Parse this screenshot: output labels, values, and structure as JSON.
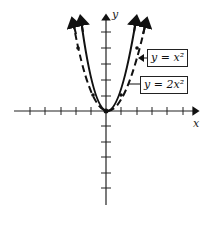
{
  "labels": {
    "curve1": "y = x²",
    "curve2": "y = 2x²",
    "x_axis": "x",
    "y_axis": "y"
  },
  "diagram": {
    "type": "coordinate-plane-parabolas",
    "x_ticks_each_side": 5,
    "y_ticks_above": 5,
    "y_ticks_below": 5,
    "curves": [
      {
        "name": "y = x²",
        "style": "dashed",
        "arrows": "both-ends"
      },
      {
        "name": "y = 2x²",
        "style": "solid",
        "arrows": "both-ends"
      }
    ]
  }
}
